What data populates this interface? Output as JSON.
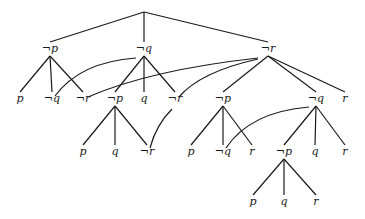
{
  "diagram": {
    "type": "tree",
    "root": {
      "id": "root",
      "label": "",
      "x": 144,
      "y": 12
    },
    "nodes": [
      {
        "id": "n1",
        "label": "¬p",
        "x": 50,
        "y": 52
      },
      {
        "id": "n2",
        "label": "¬q",
        "x": 144,
        "y": 52
      },
      {
        "id": "n3",
        "label": "¬r",
        "x": 268,
        "y": 52
      },
      {
        "id": "n1a",
        "label": "p",
        "x": 20,
        "y": 102
      },
      {
        "id": "n1b",
        "label": "¬q",
        "x": 52,
        "y": 102
      },
      {
        "id": "n1c",
        "label": "¬r",
        "x": 83,
        "y": 102
      },
      {
        "id": "n2a",
        "label": "¬p",
        "x": 115,
        "y": 102
      },
      {
        "id": "n2b",
        "label": "q",
        "x": 144,
        "y": 102
      },
      {
        "id": "n2c",
        "label": "¬r",
        "x": 175,
        "y": 102
      },
      {
        "id": "n3a",
        "label": "¬p",
        "x": 223,
        "y": 102
      },
      {
        "id": "n3b",
        "label": "¬q",
        "x": 316,
        "y": 102
      },
      {
        "id": "n3c",
        "label": "r",
        "x": 345,
        "y": 102
      },
      {
        "id": "n2a1",
        "label": "p",
        "x": 83,
        "y": 155
      },
      {
        "id": "n2a2",
        "label": "q",
        "x": 115,
        "y": 155
      },
      {
        "id": "n2a3",
        "label": "¬r",
        "x": 147,
        "y": 155
      },
      {
        "id": "n3a1",
        "label": "p",
        "x": 191,
        "y": 155
      },
      {
        "id": "n3a2",
        "label": "¬q",
        "x": 223,
        "y": 155
      },
      {
        "id": "n3a3",
        "label": "r",
        "x": 252,
        "y": 155
      },
      {
        "id": "n3b1",
        "label": "¬p",
        "x": 284,
        "y": 155
      },
      {
        "id": "n3b2",
        "label": "q",
        "x": 315,
        "y": 155
      },
      {
        "id": "n3b3",
        "label": "r",
        "x": 345,
        "y": 155
      },
      {
        "id": "n3b1a",
        "label": "p",
        "x": 253,
        "y": 205
      },
      {
        "id": "n3b1b",
        "label": "q",
        "x": 284,
        "y": 205
      },
      {
        "id": "n3b1c",
        "label": "r",
        "x": 316,
        "y": 205
      }
    ],
    "edges": [
      [
        "root",
        "n1"
      ],
      [
        "root",
        "n2"
      ],
      [
        "root",
        "n3"
      ],
      [
        "n1",
        "n1a"
      ],
      [
        "n1",
        "n1b"
      ],
      [
        "n1",
        "n1c"
      ],
      [
        "n2",
        "n2a"
      ],
      [
        "n2",
        "n2b"
      ],
      [
        "n2",
        "n2c"
      ],
      [
        "n3",
        "n3a"
      ],
      [
        "n3",
        "n3b"
      ],
      [
        "n3",
        "n3c"
      ],
      [
        "n2a",
        "n2a1"
      ],
      [
        "n2a",
        "n2a2"
      ],
      [
        "n2a",
        "n2a3"
      ],
      [
        "n3a",
        "n3a1"
      ],
      [
        "n3a",
        "n3a2"
      ],
      [
        "n3a",
        "n3a3"
      ],
      [
        "n3b",
        "n3b1"
      ],
      [
        "n3b",
        "n3b2"
      ],
      [
        "n3b",
        "n3b3"
      ],
      [
        "n3b1",
        "n3b1a"
      ],
      [
        "n3b1",
        "n3b1b"
      ],
      [
        "n3b1",
        "n3b1c"
      ]
    ],
    "cross_links": [
      {
        "from": "n2",
        "to": "n1b",
        "path": "M136,58 Q80,62 55,96"
      },
      {
        "from": "n3",
        "to": "n1c",
        "path": "M258,58 Q150,70 88,97"
      },
      {
        "from": "n3",
        "to": "n2c",
        "path": "M258,59 Q200,72 179,97"
      },
      {
        "from": "n2c",
        "to": "n2a3",
        "path": "M172,109 Q156,125 150,148"
      },
      {
        "from": "n3b",
        "to": "n3a2",
        "path": "M309,107 Q250,112 226,148"
      }
    ]
  }
}
